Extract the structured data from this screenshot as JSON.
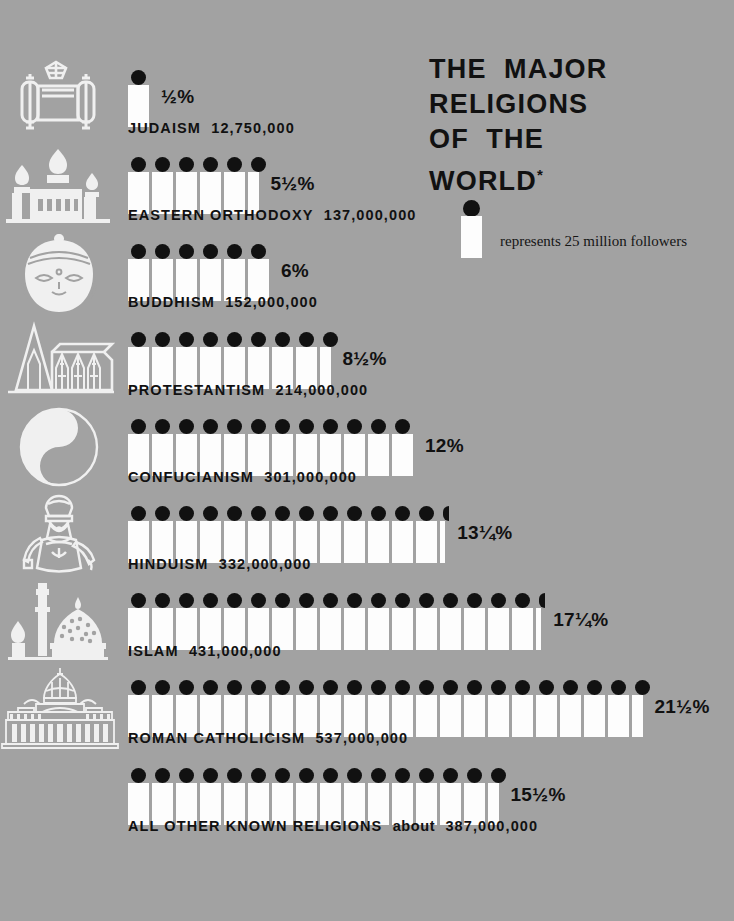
{
  "title": {
    "lines": [
      "THE  MAJOR",
      "RELIGIONS",
      "OF  THE",
      "WORLD"
    ],
    "asterisk": "*"
  },
  "legend": {
    "icon": "unit-key-icon",
    "text": "represents 25 million followers",
    "unit_value": 25000000
  },
  "colors": {
    "background": "#a2a2a2",
    "ink": "#111111",
    "bar_fill": "#fdfdfd",
    "icon": "#f2f2f2"
  },
  "chart_data": {
    "type": "bar",
    "title": "THE MAJOR RELIGIONS OF THE WORLD",
    "xlabel": "",
    "ylabel": "",
    "unit_label": "represents 25 million followers",
    "unit_value": 25000000,
    "value_field": "followers",
    "categories": [
      "JUDAISM",
      "EASTERN ORTHODOXY",
      "BUDDHISM",
      "PROTESTANTISM",
      "CONFUCIANISM",
      "HINDUISM",
      "ISLAM",
      "ROMAN CATHOLICISM",
      "ALL OTHER KNOWN RELIGIONS"
    ],
    "values": [
      12750000,
      137000000,
      152000000,
      214000000,
      301000000,
      332000000,
      431000000,
      537000000,
      387000000
    ],
    "percent_labels": [
      "½%",
      "5½%",
      "6%",
      "8½%",
      "12%",
      "13¼%",
      "17¼%",
      "21½%",
      "15½%"
    ],
    "percent_values": [
      0.5,
      5.5,
      6,
      8.5,
      12,
      13.25,
      17.25,
      21.5,
      15.5
    ],
    "units": [
      1,
      5.5,
      6,
      8.5,
      12,
      13.25,
      17.25,
      21.5,
      15.5
    ]
  },
  "rows": [
    {
      "id": "judaism",
      "icon": "torah-scroll-icon",
      "name": "JUDAISM",
      "qualifier": "",
      "followers": "12,750,000",
      "label": "JUDAISM  12,750,000",
      "percent": "½%",
      "units": 1
    },
    {
      "id": "eastern-orthodoxy",
      "icon": "orthodox-church-icon",
      "name": "EASTERN  ORTHODOXY",
      "qualifier": "",
      "followers": "137,000,000",
      "label": "EASTERN  ORTHODOXY  137,000,000",
      "percent": "5½%",
      "units": 5.5
    },
    {
      "id": "buddhism",
      "icon": "buddha-head-icon",
      "name": "BUDDHISM",
      "qualifier": "",
      "followers": "152,000,000",
      "label": "BUDDHISM  152,000,000",
      "percent": "6%",
      "units": 6
    },
    {
      "id": "protestantism",
      "icon": "protestant-church-icon",
      "name": "PROTESTANTISM",
      "qualifier": "",
      "followers": "214,000,000",
      "label": "PROTESTANTISM  214,000,000",
      "percent": "8½%",
      "units": 8.5
    },
    {
      "id": "confucianism",
      "icon": "yin-yang-icon",
      "name": "CONFUCIANISM",
      "qualifier": "",
      "followers": "301,000,000",
      "label": "CONFUCIANISM  301,000,000",
      "percent": "12%",
      "units": 12
    },
    {
      "id": "hinduism",
      "icon": "hindu-deity-icon",
      "name": "HINDUISM",
      "qualifier": "",
      "followers": "332,000,000",
      "label": "HINDUISM  332,000,000",
      "percent": "13¼%",
      "units": 13.25
    },
    {
      "id": "islam",
      "icon": "mosque-icon",
      "name": "ISLAM",
      "qualifier": "",
      "followers": "431,000,000",
      "label": "ISLAM  431,000,000",
      "percent": "17¼%",
      "units": 17.25
    },
    {
      "id": "roman-catholicism",
      "icon": "basilica-icon",
      "name": "ROMAN  CATHOLICISM",
      "qualifier": "",
      "followers": "537,000,000",
      "label": "ROMAN  CATHOLICISM  537,000,000",
      "percent": "21½%",
      "units": 21.5
    },
    {
      "id": "all-other",
      "icon": "none",
      "name": "ALL  OTHER  KNOWN  RELIGIONS",
      "qualifier": "about",
      "followers": "387,000,000",
      "label": "ALL  OTHER  KNOWN  RELIGIONS  about  387,000,000",
      "percent": "15½%",
      "units": 15.5
    }
  ]
}
